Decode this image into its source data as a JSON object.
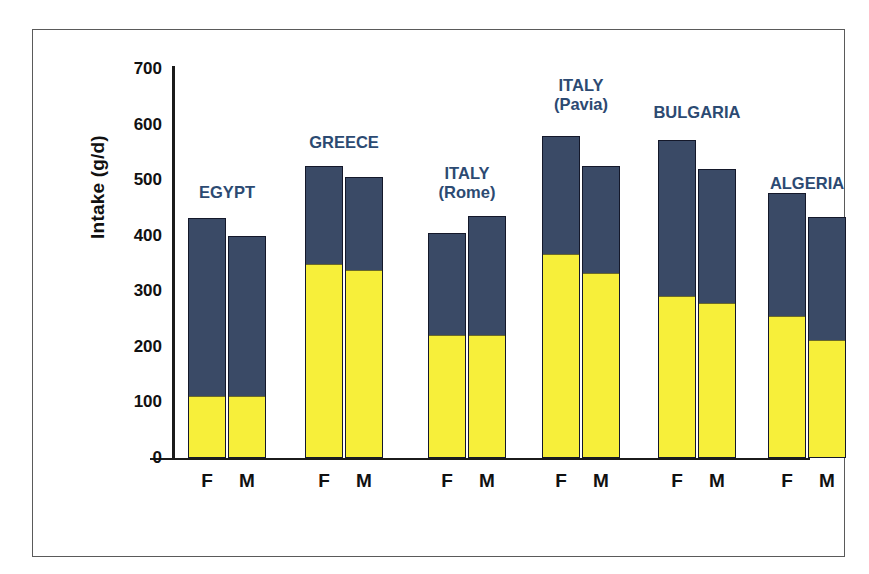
{
  "chart_data": {
    "type": "bar",
    "title": "",
    "xlabel": "",
    "ylabel": "Intake (g/d)",
    "ylim": [
      0,
      700
    ],
    "yticks": [
      0,
      100,
      200,
      300,
      400,
      500,
      600,
      700
    ],
    "grid": false,
    "legend": null,
    "stacked": true,
    "categories": [
      "EGYPT",
      "EGYPT",
      "GREECE",
      "GREECE",
      "ITALY (Rome)",
      "ITALY (Rome)",
      "ITALY (Pavia)",
      "ITALY (Pavia)",
      "BULGARIA",
      "BULGARIA",
      "ALGERIA",
      "ALGERIA"
    ],
    "x": [
      "F",
      "M",
      "F",
      "M",
      "F",
      "M",
      "F",
      "M",
      "F",
      "M",
      "F",
      "M"
    ],
    "series": [
      {
        "name": "lower-segment",
        "color": "#f7ef3a",
        "values": [
          110,
          110,
          348,
          337,
          219,
          219,
          366,
          331,
          290,
          277,
          254,
          211
        ]
      },
      {
        "name": "upper-segment",
        "color": "#3a4a66",
        "values": [
          322,
          290,
          177,
          168,
          185,
          216,
          213,
          194,
          282,
          243,
          223,
          223
        ]
      }
    ],
    "totals": [
      432,
      400,
      525,
      505,
      404,
      435,
      579,
      525,
      572,
      520,
      477,
      434
    ]
  },
  "chart": {
    "y_axis_title": "Intake (g/d)",
    "y_tick_labels": [
      "700",
      "600",
      "500",
      "400",
      "300",
      "200",
      "100",
      "0"
    ],
    "groups": [
      {
        "label": "EGYPT",
        "label_lines": [
          "EGYPT"
        ],
        "bars": [
          {
            "sex": "F",
            "total": 432,
            "lower": 110
          },
          {
            "sex": "M",
            "total": 400,
            "lower": 110
          }
        ]
      },
      {
        "label": "GREECE",
        "label_lines": [
          "GREECE"
        ],
        "bars": [
          {
            "sex": "F",
            "total": 525,
            "lower": 348
          },
          {
            "sex": "M",
            "total": 505,
            "lower": 337
          }
        ]
      },
      {
        "label": "ITALY (Rome)",
        "label_lines": [
          "ITALY",
          "(Rome)"
        ],
        "bars": [
          {
            "sex": "F",
            "total": 404,
            "lower": 219
          },
          {
            "sex": "M",
            "total": 435,
            "lower": 219
          }
        ]
      },
      {
        "label": "ITALY (Pavia)",
        "label_lines": [
          "ITALY",
          "(Pavia)"
        ],
        "bars": [
          {
            "sex": "F",
            "total": 579,
            "lower": 366
          },
          {
            "sex": "M",
            "total": 525,
            "lower": 331
          }
        ]
      },
      {
        "label": "BULGARIA",
        "label_lines": [
          "BULGARIA"
        ],
        "bars": [
          {
            "sex": "F",
            "total": 572,
            "lower": 290
          },
          {
            "sex": "M",
            "total": 520,
            "lower": 277
          }
        ]
      },
      {
        "label": "ALGERIA",
        "label_lines": [
          "ALGERIA"
        ],
        "bars": [
          {
            "sex": "F",
            "total": 477,
            "lower": 254
          },
          {
            "sex": "M",
            "total": 434,
            "lower": 211
          }
        ]
      }
    ],
    "colors": {
      "upper_segment": "#3a4a66",
      "lower_segment": "#f7ef3a",
      "group_label": "#2c4a72",
      "axis": "#1b1b1b",
      "frame": "#5a5a5a"
    }
  }
}
